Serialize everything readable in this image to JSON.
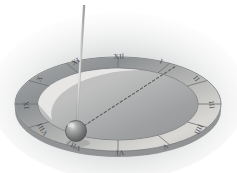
{
  "figure": {
    "kind": "grayscale-isometric-sundial-illustration",
    "background_color": "#ffffff",
    "vignette_color": "#b9bcbd"
  },
  "dial": {
    "name": "horizontal-sundial-plate",
    "plate_fill_light": "#f1f0ee",
    "plate_fill_dark": "#9a9c9d",
    "rim_fill_light": "#d8d7d4",
    "rim_fill_dark": "#8d9092",
    "rim_edge_color": "#6f7274",
    "center_x": 118,
    "center_y": 104,
    "outer_rx": 103,
    "outer_ry": 47,
    "inner_rx": 80,
    "inner_ry": 36
  },
  "gnomon": {
    "name": "gnomon-rod",
    "color": "#c9c9c7",
    "edge_color": "#9b9b99",
    "top_x": 84,
    "top_y": 5,
    "base_x": 76,
    "base_y": 130,
    "width": 2.1
  },
  "nodus": {
    "name": "nodus-sphere",
    "cx": 76,
    "cy": 131,
    "r": 10.5,
    "fill_highlight": "#d4d4d2",
    "fill_mid": "#8e8f8d",
    "fill_shadow": "#5d5f5e",
    "edge_color": "#4e5051"
  },
  "shadow_line": {
    "name": "shadow-sight-line",
    "style": "dashed",
    "color": "#5a5c5d",
    "x1": 76,
    "y1": 131,
    "x2": 176,
    "y2": 66,
    "dash": "2.6 2.2"
  },
  "hour_marks": {
    "label": "Roman hour numerals",
    "tick_color": "#6d7072",
    "numerals": [
      {
        "label": "XII",
        "angle_deg": 270,
        "rotate": -2,
        "x": 119,
        "y": 57,
        "name": "hour-numeral-xii"
      },
      {
        "label": "I",
        "angle_deg": 300,
        "rotate": 22,
        "x": 161,
        "y": 62,
        "name": "hour-numeral-i"
      },
      {
        "label": "II",
        "angle_deg": 330,
        "rotate": 52,
        "x": 196,
        "y": 79,
        "name": "hour-numeral-ii"
      },
      {
        "label": "III",
        "angle_deg": 0,
        "rotate": 84,
        "x": 211,
        "y": 105,
        "name": "hour-numeral-iii"
      },
      {
        "label": "IIII",
        "angle_deg": 30,
        "rotate": 118,
        "x": 198,
        "y": 129,
        "name": "hour-numeral-iiii"
      },
      {
        "label": "V",
        "angle_deg": 60,
        "rotate": 150,
        "x": 165,
        "y": 146,
        "name": "hour-numeral-v"
      },
      {
        "label": "VI",
        "angle_deg": 90,
        "rotate": 178,
        "x": 120,
        "y": 152,
        "name": "hour-numeral-vi"
      },
      {
        "label": "VII",
        "angle_deg": 120,
        "rotate": 208,
        "x": 76,
        "y": 146,
        "name": "hour-numeral-vii"
      },
      {
        "label": "VIII",
        "angle_deg": 150,
        "rotate": 238,
        "x": 43,
        "y": 129,
        "name": "hour-numeral-viii"
      },
      {
        "label": "IX",
        "angle_deg": 180,
        "rotate": 265,
        "x": 27,
        "y": 105,
        "name": "hour-numeral-ix"
      },
      {
        "label": "X",
        "angle_deg": 210,
        "rotate": 298,
        "x": 40,
        "y": 79,
        "name": "hour-numeral-x"
      },
      {
        "label": "XI",
        "angle_deg": 240,
        "rotate": 330,
        "x": 76,
        "y": 62,
        "name": "hour-numeral-xi"
      }
    ]
  }
}
